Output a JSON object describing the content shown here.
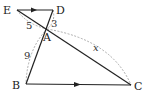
{
  "figure": {
    "points": {
      "E": {
        "label": "E",
        "x": 17,
        "y": 10
      },
      "D": {
        "label": "D",
        "x": 53,
        "y": 10
      },
      "A": {
        "label": "A",
        "x": 47,
        "y": 29
      },
      "B": {
        "label": "B",
        "x": 26,
        "y": 84
      },
      "C": {
        "label": "C",
        "x": 131,
        "y": 85
      }
    },
    "measures": {
      "EA": "5",
      "DA": "3",
      "AB": "9",
      "AC": "x"
    },
    "parallel": [
      "ED",
      "BC"
    ],
    "colors": {
      "line": "#222222",
      "dashed": "#999999",
      "text": "#222222"
    }
  }
}
